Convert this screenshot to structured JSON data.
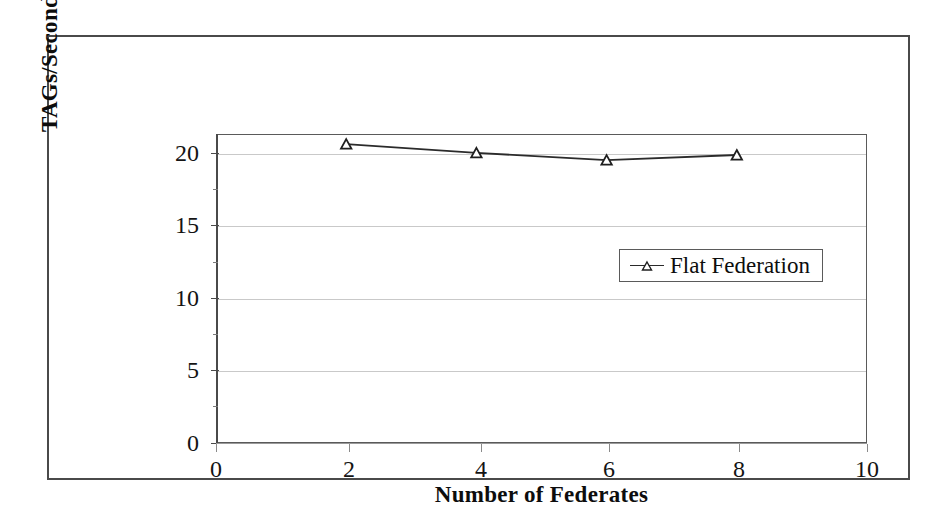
{
  "chart_data": {
    "type": "line",
    "title": "",
    "xlabel": "Number of Federates",
    "ylabel": "TAGs/Second",
    "xlim": [
      0,
      10
    ],
    "ylim": [
      0,
      21.3
    ],
    "xticks": [
      "0",
      "2",
      "4",
      "6",
      "8",
      "10"
    ],
    "yticks": [
      "0",
      "5",
      "10",
      "15",
      "20"
    ],
    "grid": true,
    "legend_position": "middle-right",
    "series": [
      {
        "name": "Flat Federation",
        "marker": "triangle",
        "x": [
          2,
          4,
          6,
          8
        ],
        "values": [
          20.6,
          20.0,
          19.5,
          19.85
        ]
      }
    ]
  },
  "axes": {
    "y_title": "TAGs/Second",
    "x_title": "Number of Federates",
    "y_labels": [
      "20",
      "15",
      "10",
      "5",
      "0"
    ],
    "x_labels": [
      "0",
      "2",
      "4",
      "6",
      "8",
      "10"
    ]
  },
  "legend": {
    "entries": [
      {
        "label": "Flat Federation",
        "marker_icon": "triangle-marker-icon"
      }
    ]
  }
}
